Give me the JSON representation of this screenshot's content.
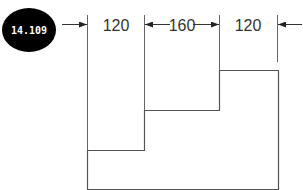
{
  "badge": {
    "label": "14.109",
    "bg_color": "#000000",
    "text_color": "#ffffff"
  },
  "dimensions": [
    {
      "label": "120",
      "from_x": 87,
      "to_x": 144
    },
    {
      "label": "160",
      "from_x": 144,
      "to_x": 219
    },
    {
      "label": "120",
      "from_x": 219,
      "to_x": 277
    }
  ],
  "colors": {
    "line": "#555555",
    "text": "#333333"
  }
}
